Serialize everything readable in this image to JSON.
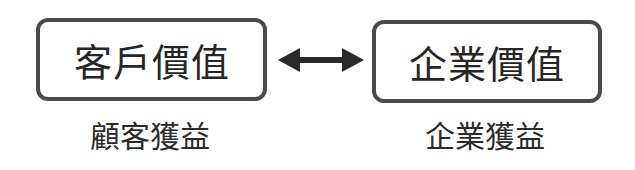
{
  "diagram": {
    "left_box": {
      "label": "客戶價值",
      "caption": "顧客獲益"
    },
    "right_box": {
      "label": "企業價值",
      "caption": "企業獲益"
    },
    "connector": {
      "type": "bidirectional-arrow",
      "color": "#2a2a2a"
    },
    "colors": {
      "border": "#4a4a4a",
      "text": "#262626",
      "background": "#ffffff"
    }
  }
}
